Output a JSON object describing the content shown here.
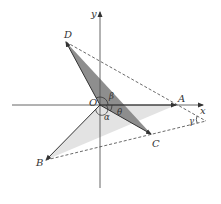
{
  "diagram": {
    "axes": {
      "x_label": "x",
      "y_label": "y",
      "origin_label": "O"
    },
    "points": {
      "A": {
        "label": "A"
      },
      "B": {
        "label": "B"
      },
      "C": {
        "label": "C"
      },
      "D": {
        "label": "D"
      }
    },
    "angles": {
      "alpha": "α",
      "beta": "β",
      "theta": "θ",
      "gamma": "γ"
    },
    "colors": {
      "axis": "#555555",
      "vector": "#333333",
      "dashed": "#444444",
      "shade_dark": "#8c8c8c",
      "shade_light": "#dcdcdc"
    }
  }
}
